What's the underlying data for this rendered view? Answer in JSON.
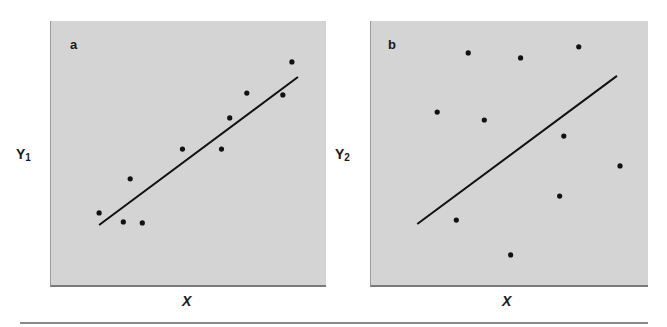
{
  "figure": {
    "panels": [
      {
        "letter": "a",
        "ylabel_main": "Y",
        "ylabel_sub": "1",
        "xlabel": "X"
      },
      {
        "letter": "b",
        "ylabel_main": "Y",
        "ylabel_sub": "2",
        "xlabel": "X"
      }
    ],
    "colors": {
      "panel_bg": "#d4d4d4",
      "points": "#111111",
      "line": "#111111",
      "rule": "#8a8a8a"
    }
  },
  "chart_data": [
    {
      "type": "scatter",
      "title": "a",
      "xlabel": "X",
      "ylabel": "Y1",
      "xlim": [
        0,
        10
      ],
      "ylim": [
        0,
        10
      ],
      "grid": false,
      "ticks": false,
      "points": [
        {
          "x": 1.75,
          "y": 2.73
        },
        {
          "x": 2.63,
          "y": 2.39
        },
        {
          "x": 2.88,
          "y": 4.02
        },
        {
          "x": 3.32,
          "y": 2.35
        },
        {
          "x": 4.78,
          "y": 5.15
        },
        {
          "x": 6.2,
          "y": 5.15
        },
        {
          "x": 6.5,
          "y": 6.33
        },
        {
          "x": 7.12,
          "y": 7.27
        },
        {
          "x": 8.43,
          "y": 7.2
        },
        {
          "x": 8.76,
          "y": 8.45
        }
      ],
      "fit_line": {
        "x1": 1.75,
        "y1": 2.27,
        "x2": 8.98,
        "y2": 7.88
      },
      "annotation": "tight fit: points cluster closely around regression line"
    },
    {
      "type": "scatter",
      "title": "b",
      "xlabel": "X",
      "ylabel": "Y2",
      "xlim": [
        0,
        10
      ],
      "ylim": [
        0,
        10
      ],
      "grid": false,
      "ticks": false,
      "points": [
        {
          "x": 2.39,
          "y": 6.55
        },
        {
          "x": 3.08,
          "y": 2.46
        },
        {
          "x": 3.51,
          "y": 8.79
        },
        {
          "x": 4.09,
          "y": 6.25
        },
        {
          "x": 5.04,
          "y": 1.14
        },
        {
          "x": 5.4,
          "y": 8.6
        },
        {
          "x": 6.81,
          "y": 3.37
        },
        {
          "x": 6.96,
          "y": 5.64
        },
        {
          "x": 7.5,
          "y": 9.02
        },
        {
          "x": 8.99,
          "y": 4.51
        }
      ],
      "fit_line": {
        "x1": 1.67,
        "y1": 2.31,
        "x2": 8.88,
        "y2": 7.92
      },
      "annotation": "loose fit: points widely scattered around same regression line"
    }
  ]
}
